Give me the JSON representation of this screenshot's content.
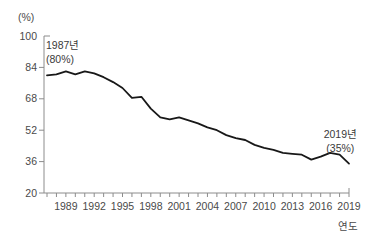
{
  "figure": {
    "background": "#ffffff",
    "line_color": "#181818",
    "axis_color": "#8c8c8c",
    "label_color": "#4a4a4a"
  },
  "chart_data": {
    "type": "line",
    "title": "",
    "xlabel": "연도",
    "ylabel": "(%)",
    "ylim": [
      20,
      100
    ],
    "yticks": [
      20,
      36,
      52,
      68,
      84,
      100
    ],
    "grid": false,
    "legend": null,
    "x": [
      1987,
      1988,
      1989,
      1990,
      1991,
      1992,
      1993,
      1994,
      1995,
      1996,
      1997,
      1998,
      1999,
      2000,
      2001,
      2002,
      2003,
      2004,
      2005,
      2006,
      2007,
      2008,
      2009,
      2010,
      2011,
      2012,
      2013,
      2014,
      2015,
      2016,
      2017,
      2018,
      2019
    ],
    "values": [
      80,
      80.5,
      82,
      80.5,
      82,
      81,
      79,
      76.5,
      73.5,
      68.5,
      69,
      63,
      58.5,
      57.5,
      58.5,
      57,
      55.5,
      53.5,
      52,
      49.5,
      48,
      47,
      44.5,
      43,
      42,
      40.5,
      40,
      39.5,
      37,
      38.5,
      40.5,
      39.5,
      35
    ],
    "xtick_labels": [
      "1989",
      "1992",
      "1995",
      "1998",
      "2001",
      "2004",
      "2007",
      "2010",
      "2013",
      "2016",
      "2019"
    ],
    "annotations": [
      {
        "lines": [
          "1987년",
          "(80%)"
        ],
        "anchor_year": 1987
      },
      {
        "lines": [
          "2019년",
          "(35%)"
        ],
        "anchor_year": 2019
      }
    ]
  }
}
